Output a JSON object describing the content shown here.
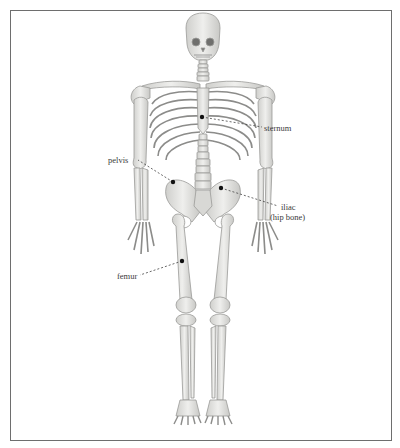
{
  "figure": {
    "labels": [
      {
        "id": "sternum",
        "text": "sternum",
        "dot": [
          202,
          117
        ],
        "text_pos": [
          264,
          124
        ]
      },
      {
        "id": "pelvis",
        "text": "pelvis",
        "dot": [
          173,
          182
        ],
        "text_pos": [
          108,
          156
        ]
      },
      {
        "id": "iliac",
        "text": "iliac",
        "subtext": "(hip bone)",
        "dot": [
          221,
          188
        ],
        "text_pos": [
          280,
          203
        ]
      },
      {
        "id": "femur",
        "text": "femur",
        "dot": [
          182,
          261
        ],
        "text_pos": [
          117,
          272
        ]
      }
    ]
  },
  "colors": {
    "bone_fill": "#e6e6e4",
    "bone_stroke": "#9a9a98",
    "bone_shade": "#c9c9c6",
    "border": "#6e6e6e",
    "leader": "#444444",
    "text": "#3a3a3a"
  }
}
